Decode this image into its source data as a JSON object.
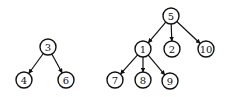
{
  "diagram": {
    "type": "forest",
    "trees": [
      {
        "root": "3",
        "nodes": [
          {
            "id": "3",
            "label": "3",
            "x": 48,
            "y": 47
          },
          {
            "id": "4",
            "label": "4",
            "x": 24,
            "y": 80
          },
          {
            "id": "6",
            "label": "6",
            "x": 66,
            "y": 80
          }
        ],
        "edges": [
          {
            "from": "3",
            "to": "4"
          },
          {
            "from": "3",
            "to": "6"
          }
        ]
      },
      {
        "root": "5",
        "nodes": [
          {
            "id": "5",
            "label": "5",
            "x": 171,
            "y": 16
          },
          {
            "id": "1",
            "label": "1",
            "x": 143,
            "y": 49
          },
          {
            "id": "2",
            "label": "2",
            "x": 172,
            "y": 49
          },
          {
            "id": "10",
            "label": "10",
            "x": 206,
            "y": 49
          },
          {
            "id": "7",
            "label": "7",
            "x": 115,
            "y": 80
          },
          {
            "id": "8",
            "label": "8",
            "x": 143,
            "y": 80
          },
          {
            "id": "9",
            "label": "9",
            "x": 170,
            "y": 81
          }
        ],
        "edges": [
          {
            "from": "5",
            "to": "1"
          },
          {
            "from": "5",
            "to": "2"
          },
          {
            "from": "5",
            "to": "10"
          },
          {
            "from": "1",
            "to": "7"
          },
          {
            "from": "1",
            "to": "8"
          },
          {
            "from": "1",
            "to": "9"
          }
        ]
      }
    ],
    "node_radius": 8,
    "colors": {
      "stroke": "#111111",
      "fill": "#ffffff",
      "background": "#ffffff"
    }
  }
}
